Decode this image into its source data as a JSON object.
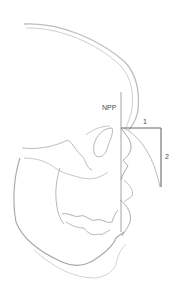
{
  "diagram": {
    "labels": {
      "npp": "NPP",
      "measure1": "1",
      "measure2": "2"
    },
    "colors": {
      "skull_stroke": "#bdbdbd",
      "skull_stroke_dark": "#a0a0a0",
      "measure_line": "#6a6a6a",
      "reference_line": "#9a9a9a",
      "text": "#4a4a4a"
    }
  }
}
